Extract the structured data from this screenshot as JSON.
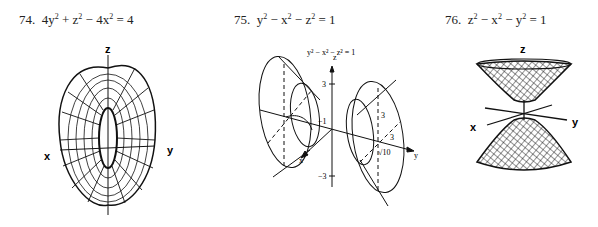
{
  "problems": [
    {
      "number": "74.",
      "equation_parts": [
        "4y",
        "2",
        " + z",
        "2",
        " − 4x",
        "2",
        " = 4"
      ],
      "figure": {
        "type": "hyperboloid-of-one-sheet",
        "axes": {
          "x": "x",
          "y": "y",
          "z": "z"
        }
      }
    },
    {
      "number": "75.",
      "equation_parts": [
        "y",
        "2",
        " − x",
        "2",
        " − z",
        "2",
        " = 1"
      ],
      "figure": {
        "type": "hyperboloid-of-two-sheets",
        "caption": "y² − x² − z² = 1",
        "axes": {
          "x": "x",
          "y": "y",
          "z": "z"
        },
        "tick_labels": {
          "z_pos": "3",
          "z_neg": "−3",
          "y_neg": "−1",
          "trace_z": "3",
          "trace_x": "3",
          "y_val": "√10"
        }
      }
    },
    {
      "number": "76.",
      "equation_parts": [
        "z",
        "2",
        " − x",
        "2",
        " − y",
        "2",
        " = 1"
      ],
      "figure": {
        "type": "hyperboloid-of-two-sheets-vertical",
        "axes": {
          "x": "x",
          "y": "y",
          "z": "z"
        }
      }
    }
  ]
}
